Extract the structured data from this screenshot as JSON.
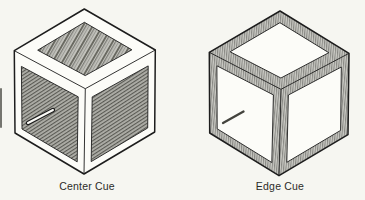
{
  "figure": {
    "type": "isometric-cube-pair-illustration",
    "colors": {
      "paper": "#f6f6f1",
      "ink": "#1d1d1d",
      "frame_white": "#fcfcf8",
      "panel_white": "#fcfcf8",
      "hatch_gray": "#8b8b85",
      "pointer_dark": "#43433d",
      "label_text": "#2b2b28"
    },
    "cubes": [
      {
        "id": "center-cue",
        "label": "Center Cue",
        "texture": "hatched face centers, plain white frame edges",
        "frame_fill": "plain",
        "panel_fill": "hatch",
        "vertices": {
          "top": [
            84.3,
            9
          ],
          "upper_left": [
            14.3,
            50.7
          ],
          "upper_right": [
            155.3,
            50
          ],
          "lower_left": [
            15,
            133
          ],
          "lower_right": [
            154.7,
            132
          ],
          "bottom": [
            84,
            174
          ],
          "front": [
            85.3,
            88.7
          ]
        },
        "insets": {
          "top_face": 11.5,
          "side_top_edge": 10.5,
          "side_other": 7
        },
        "pointer": {
          "from": [
            28,
            123
          ],
          "to": [
            53,
            110
          ],
          "style": "outlined-white",
          "location": "left face"
        },
        "label_pos": {
          "x": 87,
          "y": 180
        }
      },
      {
        "id": "edge-cue",
        "label": "Edge Cue",
        "texture": "hatched frame edges, plain white face centers",
        "frame_fill": "hatch",
        "panel_fill": "plain",
        "vertices": {
          "top": [
            280,
            11
          ],
          "upper_left": [
            209.3,
            52.3
          ],
          "upper_right": [
            349,
            53.3
          ],
          "lower_left": [
            209.7,
            133
          ],
          "lower_right": [
            348,
            134.7
          ],
          "bottom": [
            279,
            175.7
          ],
          "front": [
            281,
            89.3
          ]
        },
        "insets": {
          "top_face": 10,
          "side_top_edge": 8.5,
          "side_other": 7.5
        },
        "pointer": {
          "from": [
            223,
            123
          ],
          "to": [
            243.5,
            111.5
          ],
          "style": "solid-dark",
          "location": "left face"
        },
        "label_pos": {
          "x": 280,
          "y": 180
        }
      }
    ]
  }
}
